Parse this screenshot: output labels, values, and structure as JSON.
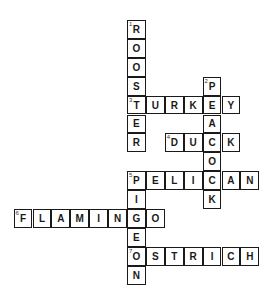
{
  "puzzle": {
    "origin": {
      "x": 127,
      "y": 20
    },
    "cell_size": 18.9,
    "words": [
      {
        "number": 1,
        "answer": "ROOSTER",
        "direction": "down",
        "row": 0,
        "col": 0
      },
      {
        "number": 2,
        "answer": "PEACOCK",
        "direction": "down",
        "row": 3,
        "col": 4
      },
      {
        "number": 3,
        "answer": "TURKEY",
        "direction": "across",
        "row": 4,
        "col": 0
      },
      {
        "number": 4,
        "answer": "DUCK",
        "direction": "across",
        "row": 6,
        "col": 2
      },
      {
        "number": 5,
        "answer": "PELICAN",
        "direction": "across",
        "row": 8,
        "col": 0
      },
      {
        "number": 5,
        "answer": "PIGEON",
        "direction": "down",
        "row": 8,
        "col": 0
      },
      {
        "number": 6,
        "answer": "FLAMINGO",
        "direction": "across",
        "row": 10,
        "col": -6
      },
      {
        "number": 7,
        "answer": "OSTRICH",
        "direction": "across",
        "row": 12,
        "col": 0
      }
    ]
  }
}
